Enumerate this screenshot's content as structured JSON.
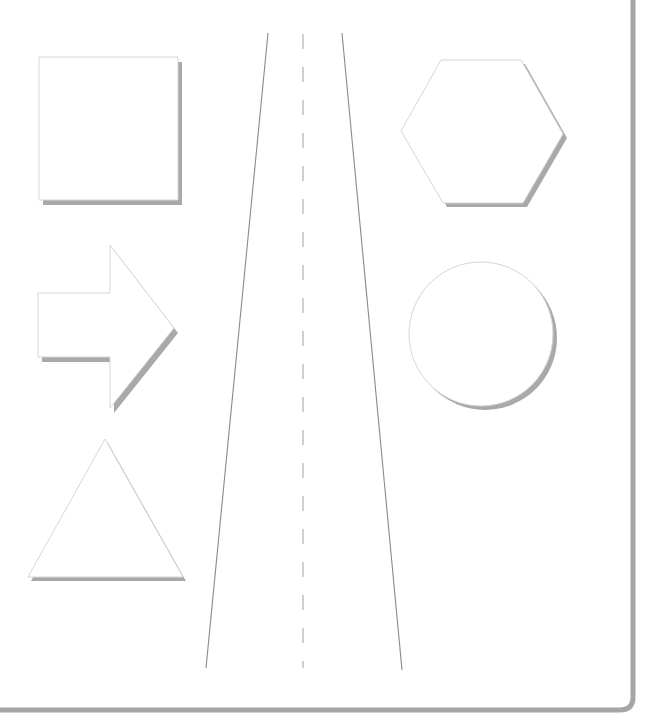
{
  "colors": {
    "background": "#ffffff",
    "shape_fill": "#ffffff",
    "shape_outline": "#d6d6d6",
    "shadow": "#a9a9a9",
    "road_line": "#8a8a8a",
    "road_dash": "#d0d0d0",
    "frame": "#a5a5a5"
  },
  "frame": {
    "right_x": 633,
    "bottom_y": 710,
    "corner_radius": 13,
    "stroke_width": 5
  },
  "shapes": [
    {
      "id": "square",
      "type": "polygon",
      "points": [
        [
          39,
          57
        ],
        [
          178,
          57
        ],
        [
          178,
          200
        ],
        [
          39,
          200
        ]
      ],
      "shadow_offset": [
        4,
        5
      ]
    },
    {
      "id": "arrow",
      "type": "polygon",
      "points": [
        [
          38,
          293
        ],
        [
          110,
          293
        ],
        [
          110,
          245
        ],
        [
          174,
          328
        ],
        [
          110,
          408
        ],
        [
          110,
          357
        ],
        [
          38,
          357
        ]
      ],
      "shadow_offset": [
        4,
        5
      ]
    },
    {
      "id": "triangle",
      "type": "polygon",
      "points": [
        [
          105,
          439
        ],
        [
          183,
          577
        ],
        [
          28,
          577
        ]
      ],
      "shadow_offset": [
        3,
        4
      ]
    },
    {
      "id": "hexagon",
      "type": "polygon",
      "points": [
        [
          441,
          60
        ],
        [
          521,
          60
        ],
        [
          563,
          134
        ],
        [
          523,
          203
        ],
        [
          443,
          203
        ],
        [
          401,
          131
        ]
      ],
      "shadow_offset": [
        4,
        4
      ]
    },
    {
      "id": "circle",
      "type": "circle",
      "cx": 481,
      "cy": 334,
      "r": 72,
      "shadow_offset": [
        4,
        4
      ]
    }
  ],
  "road": {
    "left_edge": [
      [
        268,
        33
      ],
      [
        206,
        668
      ]
    ],
    "right_edge": [
      [
        342,
        33
      ],
      [
        402,
        670
      ]
    ],
    "center_x": 303,
    "dash_start_y": 34,
    "dash_end_y": 668,
    "dash_length": 15,
    "dash_gap": 18
  }
}
